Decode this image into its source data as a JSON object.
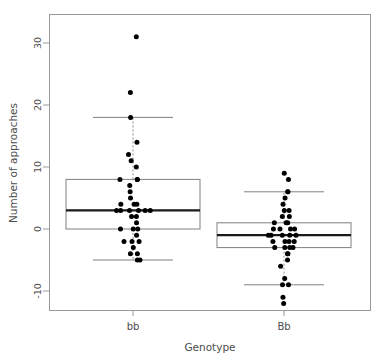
{
  "chart_data": {
    "type": "box",
    "title": "",
    "xlabel": "Genotype",
    "ylabel": "Number of approaches",
    "categories": [
      "bb",
      "Bb"
    ],
    "yticks": [
      -10,
      0,
      10,
      20,
      30
    ],
    "ytick_labels": [
      "-10",
      "0",
      "10",
      "20",
      "30"
    ],
    "ylim": [
      -13.5,
      34.5
    ],
    "grid": false,
    "legend": "none",
    "overlay": "jittered points",
    "boxes": [
      {
        "category": "bb",
        "lower_whisker": -5,
        "q1": 0,
        "median": 3,
        "q3": 8,
        "upper_whisker": 18,
        "points": [
          31,
          22,
          18,
          14,
          12,
          11,
          10,
          8,
          8,
          8,
          7,
          6,
          5,
          4,
          4,
          4,
          3,
          3,
          3,
          3,
          3,
          3,
          2,
          2,
          1,
          0,
          0,
          0,
          -1,
          -2,
          -2,
          -2,
          -3,
          -4,
          -4,
          -5,
          -5
        ]
      },
      {
        "category": "Bb",
        "lower_whisker": -9,
        "q1": -3,
        "median": -1,
        "q3": 1,
        "upper_whisker": 6,
        "points": [
          9,
          8,
          6,
          6,
          5,
          4,
          3,
          3,
          2,
          2,
          1,
          1,
          1,
          0,
          0,
          0,
          0,
          -1,
          -1,
          -1,
          -1,
          -1,
          -2,
          -2,
          -2,
          -2,
          -3,
          -3,
          -3,
          -3,
          -4,
          -4,
          -5,
          -6,
          -8,
          -9,
          -9,
          -11,
          -12
        ]
      }
    ],
    "colors": {
      "box_border": "#808080",
      "median": "#1a1a1a",
      "whisker": "#808080",
      "point": "#000000",
      "frame": "#999999",
      "axis_text": "#4d4d4d",
      "background": "#ffffff"
    }
  }
}
